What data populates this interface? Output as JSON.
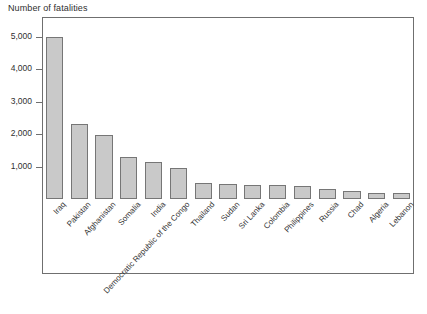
{
  "chart_data": {
    "type": "bar",
    "title": "Number of fatalities",
    "xlabel": "",
    "ylabel": "Number of fatalities",
    "ylim": [
      0,
      5600
    ],
    "yticks": [
      1000,
      2000,
      3000,
      4000,
      5000
    ],
    "ytick_labels": [
      "1,000",
      "2,000",
      "3,000",
      "4,000",
      "5,000"
    ],
    "grid": false,
    "legend": "none",
    "bar_color": "#c9c9c9",
    "bar_border_color": "#767676",
    "categories": [
      "Iraq",
      "Pakistan",
      "Afghanistan",
      "Somalia",
      "India",
      "Democratic Republic of the Congo",
      "Thailand",
      "Sudan",
      "Sri Lanka",
      "Colombia",
      "Philippines",
      "Russia",
      "Chad",
      "Algeria",
      "Lebanon"
    ],
    "values": [
      5000,
      2300,
      1980,
      1300,
      1150,
      950,
      500,
      450,
      440,
      430,
      410,
      300,
      250,
      190,
      170
    ]
  },
  "figure": {
    "axis_title": "Number of fatalities"
  }
}
